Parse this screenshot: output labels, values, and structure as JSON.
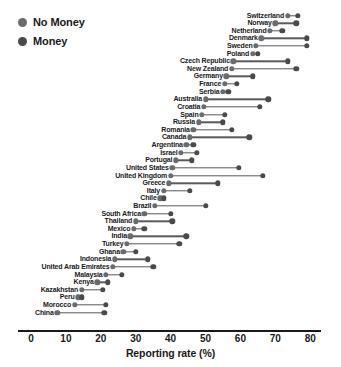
{
  "chart_data": {
    "type": "scatter",
    "subtype": "dumbbell",
    "title": "",
    "xlabel": "Reporting rate (%)",
    "ylabel": "",
    "xlim": [
      0,
      83
    ],
    "xticks": [
      0,
      10,
      20,
      30,
      40,
      50,
      60,
      70,
      80
    ],
    "grid": false,
    "legend_position": "top-left",
    "series": [
      {
        "name": "No Money",
        "color": "#6b6b6b",
        "key": "no_money"
      },
      {
        "name": "Money",
        "color": "#4a4a4a",
        "key": "money"
      }
    ],
    "categories": [
      "Switzerland",
      "Norway",
      "Netherland",
      "Denmark",
      "Sweden",
      "Poland",
      "Czech Republic",
      "New Zealand",
      "Germany",
      "France",
      "Serbia",
      "Australia",
      "Croatia",
      "Spain",
      "Russia",
      "Romania",
      "Canada",
      "Argentina",
      "Israel",
      "Portugal",
      "United States",
      "United Kingdom",
      "Greece",
      "Italy",
      "Chile",
      "Brazil",
      "South Africa",
      "Thailand",
      "Mexico",
      "India",
      "Turkey",
      "Ghana",
      "Indonesia",
      "United Arab Emirates",
      "Malaysia",
      "Kenya",
      "Kazakhstan",
      "Peru",
      "Morocco",
      "China"
    ],
    "points": [
      {
        "country": "Switzerland",
        "no_money": 73.5,
        "money": 76.5
      },
      {
        "country": "Norway",
        "no_money": 70.0,
        "money": 76.0
      },
      {
        "country": "Netherland",
        "no_money": 68.5,
        "money": 72.0
      },
      {
        "country": "Denmark",
        "no_money": 66.0,
        "money": 79.0
      },
      {
        "country": "Sweden",
        "no_money": 64.5,
        "money": 79.0
      },
      {
        "country": "Poland",
        "no_money": 63.5,
        "money": 65.0
      },
      {
        "country": "Czech Republic",
        "no_money": 58.0,
        "money": 73.5
      },
      {
        "country": "New Zealand",
        "no_money": 57.5,
        "money": 76.0
      },
      {
        "country": "Germany",
        "no_money": 56.0,
        "money": 63.5
      },
      {
        "country": "France",
        "no_money": 55.5,
        "money": 59.0
      },
      {
        "country": "Serbia",
        "no_money": 55.0,
        "money": 56.5
      },
      {
        "country": "Australia",
        "no_money": 50.0,
        "money": 68.0
      },
      {
        "country": "Croatia",
        "no_money": 49.5,
        "money": 65.5
      },
      {
        "country": "Spain",
        "no_money": 49.0,
        "money": 55.5
      },
      {
        "country": "Russia",
        "no_money": 48.0,
        "money": 55.0
      },
      {
        "country": "Romania",
        "no_money": 46.5,
        "money": 57.5
      },
      {
        "country": "Canada",
        "no_money": 45.5,
        "money": 62.5
      },
      {
        "country": "Argentina",
        "no_money": 44.5,
        "money": 46.5
      },
      {
        "country": "Israel",
        "no_money": 43.0,
        "money": 47.5
      },
      {
        "country": "Portugal",
        "no_money": 41.5,
        "money": 46.0
      },
      {
        "country": "United States",
        "no_money": 40.5,
        "money": 59.5
      },
      {
        "country": "United Kingdom",
        "no_money": 40.0,
        "money": 66.5
      },
      {
        "country": "Greece",
        "no_money": 39.5,
        "money": 53.5
      },
      {
        "country": "Italy",
        "no_money": 38.0,
        "money": 45.5
      },
      {
        "country": "Chile",
        "no_money": 37.0,
        "money": 38.0
      },
      {
        "country": "Brazil",
        "no_money": 35.5,
        "money": 50.0
      },
      {
        "country": "South Africa",
        "no_money": 32.5,
        "money": 40.0
      },
      {
        "country": "Thailand",
        "no_money": 30.0,
        "money": 40.5
      },
      {
        "country": "Mexico",
        "no_money": 29.5,
        "money": 32.5
      },
      {
        "country": "India",
        "no_money": 28.5,
        "money": 44.5
      },
      {
        "country": "Turkey",
        "no_money": 27.5,
        "money": 42.5
      },
      {
        "country": "Ghana",
        "no_money": 26.5,
        "money": 30.0
      },
      {
        "country": "Indonesia",
        "no_money": 24.0,
        "money": 33.5
      },
      {
        "country": "United Arab Emirates",
        "no_money": 23.5,
        "money": 35.0
      },
      {
        "country": "Malaysia",
        "no_money": 21.5,
        "money": 26.0
      },
      {
        "country": "Kenya",
        "no_money": 19.0,
        "money": 22.0
      },
      {
        "country": "Kazakhstan",
        "no_money": 14.5,
        "money": 20.5
      },
      {
        "country": "Peru",
        "no_money": 13.5,
        "money": 14.5
      },
      {
        "country": "Morocco",
        "no_money": 12.5,
        "money": 21.5
      },
      {
        "country": "China",
        "no_money": 7.5,
        "money": 21.0
      }
    ]
  },
  "legend": {
    "items": [
      {
        "label": "No Money",
        "color": "#6b6b6b"
      },
      {
        "label": "Money",
        "color": "#4a4a4a"
      }
    ]
  },
  "axis": {
    "title": "Reporting rate (%)",
    "ticks": [
      "0",
      "10",
      "20",
      "30",
      "40",
      "50",
      "60",
      "70",
      "80"
    ]
  },
  "colors": {
    "no_money_dot": "#6b6b6b",
    "money_dot": "#4a4a4a",
    "connector": "#5a5a5a",
    "axis": "#1a1a1a",
    "background": "#ffffff"
  }
}
